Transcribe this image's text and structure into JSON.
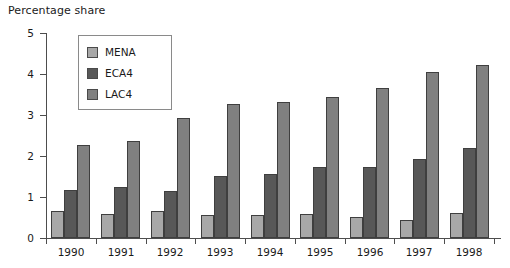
{
  "chart_data": {
    "type": "bar",
    "title": "Percentage share",
    "xlabel": "",
    "ylabel": "",
    "ylim": [
      0,
      5
    ],
    "yticks": [
      "0",
      "1",
      "2",
      "3",
      "4",
      "5"
    ],
    "grid": false,
    "legend_position": "top-left-inside",
    "categories": [
      "1990",
      "1991",
      "1992",
      "1993",
      "1994",
      "1995",
      "1996",
      "1997",
      "1998"
    ],
    "series": [
      {
        "name": "MENA",
        "color": "#a8a8a8",
        "values": [
          0.65,
          0.58,
          0.65,
          0.57,
          0.55,
          0.58,
          0.52,
          0.45,
          0.62
        ]
      },
      {
        "name": "ECA4",
        "color": "#585858",
        "values": [
          1.18,
          1.25,
          1.15,
          1.52,
          1.57,
          1.72,
          1.73,
          1.92,
          2.2
        ]
      },
      {
        "name": "LAC4",
        "color": "#808080",
        "values": [
          2.28,
          2.37,
          2.93,
          3.27,
          3.32,
          3.45,
          3.67,
          4.05,
          4.22
        ]
      }
    ]
  }
}
